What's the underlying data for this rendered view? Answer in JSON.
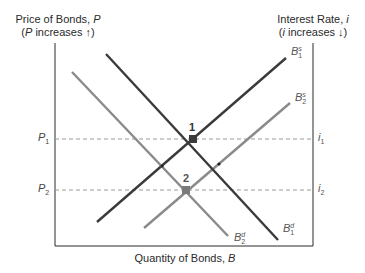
{
  "diagram": {
    "type": "supply-demand-bond-market",
    "left_axis": {
      "title": "Price of Bonds, P",
      "title_plain": "Price of Bonds, ",
      "title_var": "P",
      "subtitle_open": "(",
      "subtitle_var": "P",
      "subtitle_text": " increases ↑)"
    },
    "right_axis": {
      "title_plain": "Interest Rate, ",
      "title_var": "i",
      "subtitle_open": "(",
      "subtitle_var": "i",
      "subtitle_text": " increases ↓)"
    },
    "x_axis": {
      "title_plain": "Quantity of Bonds, ",
      "title_var": "B"
    },
    "levels": [
      {
        "left_var": "P",
        "left_sub": "1",
        "right_var": "i",
        "right_sub": "1",
        "y": 139
      },
      {
        "left_var": "P",
        "left_sub": "2",
        "right_var": "i",
        "right_sub": "2",
        "y": 190
      }
    ],
    "curves": [
      {
        "name": "B",
        "sup": "s",
        "sub": "1",
        "kind": "supply",
        "color": "#3a3a3a",
        "x1": 97,
        "y1": 222,
        "x2": 286,
        "y2": 58
      },
      {
        "name": "B",
        "sup": "s",
        "sub": "2",
        "kind": "supply",
        "color": "#8a8a8a",
        "x1": 144,
        "y1": 228,
        "x2": 290,
        "y2": 103
      },
      {
        "name": "B",
        "sup": "d",
        "sub": "1",
        "kind": "demand",
        "color": "#3a3a3a",
        "x1": 106,
        "y1": 54,
        "x2": 278,
        "y2": 240
      },
      {
        "name": "B",
        "sup": "d",
        "sub": "2",
        "kind": "demand",
        "color": "#8a8a8a",
        "x1": 72,
        "y1": 72,
        "x2": 228,
        "y2": 236
      }
    ],
    "equilibria": [
      {
        "label": "1",
        "x": 193,
        "y": 139,
        "color": "#3a3a3a"
      },
      {
        "label": "2",
        "x": 186,
        "y": 190,
        "color": "#7a7a7a"
      }
    ],
    "colors": {
      "axis": "#2a2a2a",
      "dashed": "#9a9a9a",
      "dark_curve": "#3a3a3a",
      "light_curve": "#8a8a8a"
    }
  }
}
